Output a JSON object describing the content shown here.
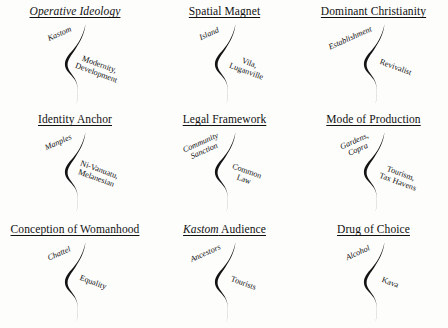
{
  "figure": {
    "background_color": "#fdfdfc",
    "ink_color": "#111111",
    "grid_rows": 3,
    "grid_cols": 3,
    "divider_glyph": "s-curve-integral"
  },
  "panels": [
    {
      "id": "operative-ideology",
      "title_prefix": "Operative Ideology",
      "title_prefix_italic": false,
      "title_suffix": "",
      "pole_a": "Kastom",
      "pole_a_italic": true,
      "pole_b_line1": "Modernity,",
      "pole_b_line2": "Development"
    },
    {
      "id": "spatial-magnet",
      "title_prefix": "Spatial Magnet",
      "title_prefix_italic": false,
      "title_suffix": "",
      "pole_a": "Island",
      "pole_a_italic": false,
      "pole_b_line1": "Vila,",
      "pole_b_line2": "Luganville"
    },
    {
      "id": "dominant-christianity",
      "title_prefix": "Dominant Christianity",
      "title_prefix_italic": false,
      "title_suffix": "",
      "pole_a": "Establishment",
      "pole_a_italic": false,
      "pole_b_line1": "Revivalist",
      "pole_b_line2": ""
    },
    {
      "id": "identity-anchor",
      "title_prefix": "Identity Anchor",
      "title_prefix_italic": false,
      "title_suffix": "",
      "pole_a": "Manples",
      "pole_a_italic": true,
      "pole_b_line1": "Ni-Vanuatu,",
      "pole_b_line2": "Melanesian"
    },
    {
      "id": "legal-framework",
      "title_prefix": "Legal Framework",
      "title_prefix_italic": false,
      "title_suffix": "",
      "pole_a_line1": "Community",
      "pole_a_line2": "Sanction",
      "pole_a": "Community Sanction",
      "pole_a_italic": false,
      "pole_b_line1": "Common",
      "pole_b_line2": "Law"
    },
    {
      "id": "mode-of-production",
      "title_prefix": "Mode of Production",
      "title_prefix_italic": false,
      "title_suffix": "",
      "pole_a_line1": "Gardens,",
      "pole_a_line2": "Copra",
      "pole_a": "Gardens, Copra",
      "pole_a_italic": false,
      "pole_b_line1": "Tourism,",
      "pole_b_line2": "Tax Havens"
    },
    {
      "id": "conception-of-womanhood",
      "title_prefix": "Conception of Womanhood",
      "title_prefix_italic": false,
      "title_suffix": "",
      "pole_a": "Chattel",
      "pole_a_italic": false,
      "pole_b_line1": "Equality",
      "pole_b_line2": ""
    },
    {
      "id": "kastom-audience",
      "title_prefix": "Kastom",
      "title_prefix_italic": true,
      "title_suffix": " Audience",
      "pole_a": "Ancestors",
      "pole_a_italic": false,
      "pole_b_line1": "Tourists",
      "pole_b_line2": ""
    },
    {
      "id": "drug-of-choice",
      "title_prefix": "Drug of Choice",
      "title_prefix_italic": false,
      "title_suffix": "",
      "pole_a": "Alcohol",
      "pole_a_italic": false,
      "pole_b_line1": "Kava",
      "pole_b_line2": ""
    }
  ]
}
